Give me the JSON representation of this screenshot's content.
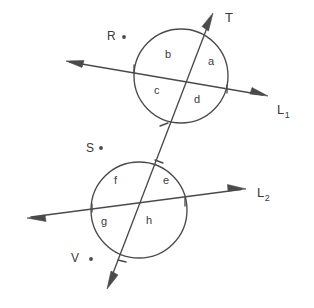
{
  "figure": {
    "stroke_color": "#4a4a4a",
    "text_color": "#3a3a3a",
    "background": "#ffffff"
  },
  "lines": [
    {
      "name": "L1",
      "label": "L",
      "subscript": "1",
      "label_x": 277,
      "label_y": 103,
      "x1": 66,
      "y1": 61,
      "x2": 268,
      "y2": 96,
      "arrow_start": true,
      "arrow_end": true
    },
    {
      "name": "L2",
      "label": "L",
      "subscript": "2",
      "label_x": 257,
      "label_y": 186,
      "x1": 27,
      "y1": 218,
      "x2": 246,
      "y2": 189,
      "arrow_start": true,
      "arrow_end": true
    },
    {
      "name": "T",
      "label": "T",
      "subscript": "",
      "label_x": 225,
      "label_y": 11,
      "x1": 213,
      "y1": 13,
      "x2": 107,
      "y2": 289,
      "arrow_start": true,
      "arrow_end": true
    }
  ],
  "circles": [
    {
      "name": "upper-circle",
      "cx": 181,
      "cy": 76,
      "r": 47
    },
    {
      "name": "lower-circle",
      "cx": 139,
      "cy": 210,
      "r": 48
    }
  ],
  "region_labels": [
    {
      "id": "a",
      "text": "a",
      "x": 208,
      "y": 62
    },
    {
      "id": "b",
      "text": "b",
      "x": 165,
      "y": 55
    },
    {
      "id": "c",
      "text": "c",
      "x": 154,
      "y": 91
    },
    {
      "id": "d",
      "text": "d",
      "x": 194,
      "y": 100
    },
    {
      "id": "e",
      "text": "e",
      "x": 163,
      "y": 181
    },
    {
      "id": "f",
      "text": "f",
      "x": 113,
      "y": 181
    },
    {
      "id": "g",
      "text": "g",
      "x": 101,
      "y": 222
    },
    {
      "id": "h",
      "text": "h",
      "x": 146,
      "y": 221
    }
  ],
  "point_labels": [
    {
      "id": "R",
      "text": "R",
      "x": 107,
      "y": 30,
      "dot_x": 124,
      "dot_y": 37
    },
    {
      "id": "S",
      "text": "S",
      "x": 86,
      "y": 142,
      "dot_x": 101,
      "dot_y": 148
    },
    {
      "id": "V",
      "text": "V",
      "x": 71,
      "y": 252,
      "dot_x": 91,
      "dot_y": 259
    }
  ],
  "tick_marks": [
    {
      "id": "tick-L1-left",
      "note": "short tick where L1 meets upper circle left"
    },
    {
      "id": "tick-L1-right",
      "note": "short tick where L1 meets upper circle right"
    },
    {
      "id": "tick-T-upper",
      "note": "short tick where T meets upper circle bottom"
    },
    {
      "id": "tick-T-lower",
      "note": "short tick where T enters lower circle top"
    },
    {
      "id": "tick-L2-left",
      "note": "short tick where L2 meets lower circle left"
    },
    {
      "id": "tick-L2-right",
      "note": "short tick where L2 meets lower circle right"
    },
    {
      "id": "tick-T-bottom",
      "note": "short tick where T exits lower circle bottom"
    }
  ]
}
